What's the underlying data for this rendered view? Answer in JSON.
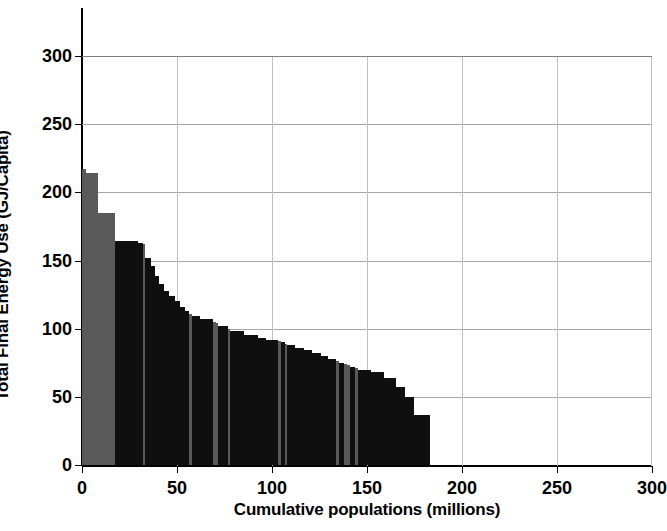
{
  "chart_data": {
    "type": "bar",
    "title": "",
    "xlabel": "Cumulative populations (millions)",
    "ylabel": "Total Final Energy Use (GJ/Capita)",
    "xlim": [
      0,
      300
    ],
    "ylim": [
      0,
      300
    ],
    "xticks": [
      0,
      50,
      100,
      150,
      200,
      250,
      300
    ],
    "yticks": [
      0,
      50,
      100,
      150,
      200,
      250,
      300
    ],
    "grid": "both",
    "legend": "none",
    "colors": {
      "bar_dark": "#0f0f0f",
      "bar_gray": "#595959",
      "axis": "#000000",
      "gridline": "#a6a6a6",
      "gridline_vertical": "#bfbfbf",
      "background": "#ffffff"
    },
    "note": "Descending staircase of per-capita final energy use, bar widths proportional to population (millions); x positions are cumulative population.",
    "bars": [
      {
        "x0": 0.0,
        "width": 2.0,
        "value": 217,
        "shade": "gray"
      },
      {
        "x0": 2.0,
        "width": 1.2,
        "value": 214,
        "shade": "gray"
      },
      {
        "x0": 3.2,
        "width": 5.0,
        "value": 214,
        "shade": "gray"
      },
      {
        "x0": 8.2,
        "width": 9.0,
        "value": 185,
        "shade": "gray"
      },
      {
        "x0": 17.2,
        "width": 12.5,
        "value": 164,
        "shade": "dark"
      },
      {
        "x0": 29.7,
        "width": 2.2,
        "value": 163,
        "shade": "dark"
      },
      {
        "x0": 31.9,
        "width": 1.4,
        "value": 162,
        "shade": "gray"
      },
      {
        "x0": 33.3,
        "width": 3.0,
        "value": 152,
        "shade": "dark"
      },
      {
        "x0": 36.3,
        "width": 2.2,
        "value": 146,
        "shade": "dark"
      },
      {
        "x0": 38.5,
        "width": 2.2,
        "value": 139,
        "shade": "dark"
      },
      {
        "x0": 40.7,
        "width": 2.6,
        "value": 133,
        "shade": "dark"
      },
      {
        "x0": 43.3,
        "width": 2.6,
        "value": 128,
        "shade": "dark"
      },
      {
        "x0": 45.9,
        "width": 3.0,
        "value": 124,
        "shade": "dark"
      },
      {
        "x0": 48.9,
        "width": 2.6,
        "value": 120,
        "shade": "dark"
      },
      {
        "x0": 51.5,
        "width": 2.6,
        "value": 116,
        "shade": "dark"
      },
      {
        "x0": 54.1,
        "width": 2.2,
        "value": 113,
        "shade": "dark"
      },
      {
        "x0": 56.3,
        "width": 1.6,
        "value": 111,
        "shade": "gray"
      },
      {
        "x0": 57.9,
        "width": 4.0,
        "value": 109,
        "shade": "dark"
      },
      {
        "x0": 61.9,
        "width": 7.0,
        "value": 107,
        "shade": "dark"
      },
      {
        "x0": 68.9,
        "width": 1.6,
        "value": 105,
        "shade": "gray"
      },
      {
        "x0": 70.5,
        "width": 1.2,
        "value": 104,
        "shade": "gray"
      },
      {
        "x0": 71.7,
        "width": 5.0,
        "value": 102,
        "shade": "dark"
      },
      {
        "x0": 76.7,
        "width": 1.4,
        "value": 100,
        "shade": "gray"
      },
      {
        "x0": 78.1,
        "width": 7.0,
        "value": 98,
        "shade": "dark"
      },
      {
        "x0": 85.1,
        "width": 7.5,
        "value": 95,
        "shade": "dark"
      },
      {
        "x0": 92.6,
        "width": 4.0,
        "value": 93,
        "shade": "dark"
      },
      {
        "x0": 96.6,
        "width": 6.5,
        "value": 92,
        "shade": "dark"
      },
      {
        "x0": 103.1,
        "width": 1.6,
        "value": 91,
        "shade": "gray"
      },
      {
        "x0": 104.7,
        "width": 2.0,
        "value": 90,
        "shade": "dark"
      },
      {
        "x0": 106.7,
        "width": 1.4,
        "value": 89,
        "shade": "gray"
      },
      {
        "x0": 108.1,
        "width": 4.0,
        "value": 88,
        "shade": "dark"
      },
      {
        "x0": 112.1,
        "width": 5.0,
        "value": 86,
        "shade": "dark"
      },
      {
        "x0": 117.1,
        "width": 4.0,
        "value": 84,
        "shade": "dark"
      },
      {
        "x0": 121.1,
        "width": 4.5,
        "value": 82,
        "shade": "dark"
      },
      {
        "x0": 125.6,
        "width": 4.0,
        "value": 80,
        "shade": "dark"
      },
      {
        "x0": 129.6,
        "width": 4.0,
        "value": 78,
        "shade": "dark"
      },
      {
        "x0": 133.6,
        "width": 1.6,
        "value": 76,
        "shade": "gray"
      },
      {
        "x0": 135.2,
        "width": 2.6,
        "value": 75,
        "shade": "dark"
      },
      {
        "x0": 137.8,
        "width": 1.6,
        "value": 74,
        "shade": "gray"
      },
      {
        "x0": 139.4,
        "width": 1.4,
        "value": 73,
        "shade": "gray"
      },
      {
        "x0": 140.8,
        "width": 3.0,
        "value": 72,
        "shade": "dark"
      },
      {
        "x0": 143.8,
        "width": 1.4,
        "value": 71,
        "shade": "gray"
      },
      {
        "x0": 145.2,
        "width": 7.0,
        "value": 70,
        "shade": "dark"
      },
      {
        "x0": 152.2,
        "width": 7.0,
        "value": 68,
        "shade": "dark"
      },
      {
        "x0": 159.2,
        "width": 6.0,
        "value": 64,
        "shade": "dark"
      },
      {
        "x0": 165.2,
        "width": 5.0,
        "value": 57,
        "shade": "dark"
      },
      {
        "x0": 170.2,
        "width": 4.5,
        "value": 50,
        "shade": "dark"
      },
      {
        "x0": 174.7,
        "width": 8.3,
        "value": 37,
        "shade": "dark"
      }
    ]
  }
}
